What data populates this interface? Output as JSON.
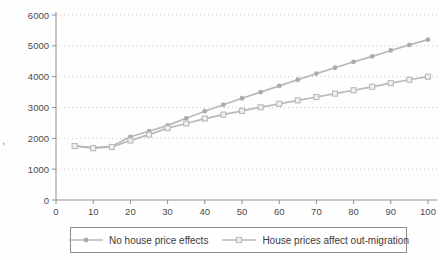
{
  "artifact": ",",
  "colors": {
    "axis": "#909090",
    "grid": "#cccccc",
    "tick_text": "#4b4b4b",
    "legend_border": "#8c8c8c",
    "legend_text": "#3a3a3a"
  },
  "chart_data": {
    "type": "line",
    "title": "",
    "xlabel": "",
    "ylabel": "",
    "xlim": [
      0,
      100
    ],
    "ylim": [
      0,
      6000
    ],
    "x_ticks": [
      0,
      10,
      20,
      30,
      40,
      50,
      60,
      70,
      80,
      90,
      100
    ],
    "y_ticks": [
      0,
      1000,
      2000,
      3000,
      4000,
      5000,
      6000
    ],
    "grid": "dotted-horizontal",
    "legend_position": "bottom-boxed",
    "axis_color": "#909090",
    "grid_color": "#cccccc",
    "x": [
      5,
      10,
      15,
      20,
      25,
      30,
      35,
      40,
      45,
      50,
      55,
      60,
      65,
      70,
      75,
      80,
      85,
      90,
      95,
      100
    ],
    "series": [
      {
        "name": "No house price effects",
        "marker": "dot",
        "color": "#b6babc",
        "marker_fill": "#a9adaf",
        "values": [
          1760,
          1700,
          1740,
          2050,
          2230,
          2420,
          2650,
          2880,
          3090,
          3300,
          3500,
          3700,
          3900,
          4100,
          4290,
          4480,
          4660,
          4850,
          5030,
          5200
        ]
      },
      {
        "name": "House prices affect out-migration",
        "marker": "square",
        "color": "#b6babc",
        "marker_fill": "#f0f0f0",
        "values": [
          1750,
          1680,
          1720,
          1930,
          2120,
          2330,
          2480,
          2640,
          2770,
          2890,
          3010,
          3120,
          3230,
          3340,
          3450,
          3560,
          3670,
          3790,
          3900,
          4000
        ]
      }
    ]
  }
}
